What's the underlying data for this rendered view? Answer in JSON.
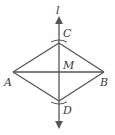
{
  "diagram": {
    "type": "geometry-construction",
    "line_label": "l",
    "points": {
      "A": {
        "label": "A",
        "x": 13,
        "y": 72
      },
      "B": {
        "label": "B",
        "x": 104,
        "y": 72
      },
      "C": {
        "label": "C",
        "x": 59,
        "y": 43
      },
      "D": {
        "label": "D",
        "x": 59,
        "y": 101
      },
      "M": {
        "label": "M",
        "x": 59,
        "y": 72
      }
    },
    "segments": [
      "AC",
      "CB",
      "BD",
      "DA",
      "AB",
      "CD"
    ],
    "colors": {
      "stroke": "#555555",
      "text": "#3a3a3a",
      "background": "#ffffff"
    }
  }
}
